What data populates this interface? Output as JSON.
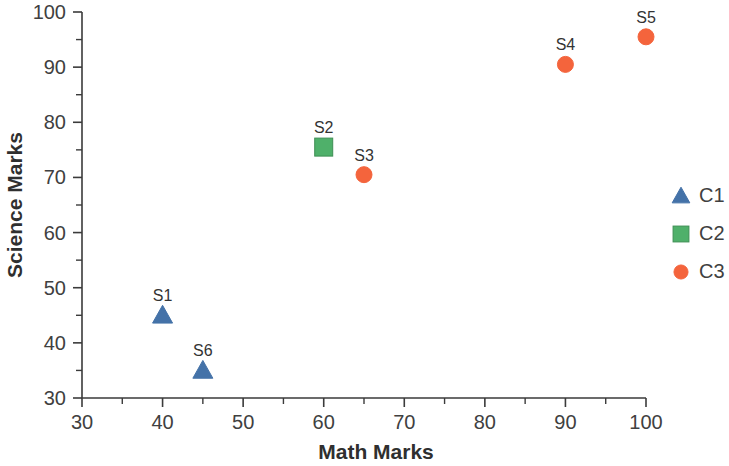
{
  "chart_data": {
    "type": "scatter",
    "title": "",
    "xlabel": "Math Marks",
    "ylabel": "Science Marks",
    "xlim": [
      30,
      100
    ],
    "ylim": [
      30,
      100
    ],
    "x_ticks": [
      30,
      40,
      50,
      60,
      70,
      80,
      90,
      100
    ],
    "y_ticks": [
      30,
      40,
      50,
      60,
      70,
      80,
      90,
      100
    ],
    "x_tick_labels": [
      "30",
      "40",
      "50",
      "60",
      "70",
      "80",
      "90",
      "100"
    ],
    "y_tick_labels": [
      "30",
      "40",
      "50",
      "60",
      "70",
      "80",
      "90",
      "100"
    ],
    "x_minor_step": 5,
    "y_minor_step": 5,
    "grid": false,
    "legend_position": "right",
    "series": [
      {
        "name": "C1",
        "marker": "triangle",
        "color": "#4472A8",
        "points": [
          {
            "label": "S1",
            "x": 40,
            "y": 45
          },
          {
            "label": "S6",
            "x": 45,
            "y": 35
          }
        ]
      },
      {
        "name": "C2",
        "marker": "square",
        "color": "#4FB06A",
        "points": [
          {
            "label": "S2",
            "x": 60,
            "y": 75.5
          }
        ]
      },
      {
        "name": "C3",
        "marker": "circle",
        "color": "#F4643C",
        "points": [
          {
            "label": "S3",
            "x": 65,
            "y": 70.5
          },
          {
            "label": "S4",
            "x": 90,
            "y": 90.5
          },
          {
            "label": "S5",
            "x": 100,
            "y": 95.5
          }
        ]
      }
    ]
  },
  "legend": {
    "entries": [
      {
        "label": "C1",
        "marker": "triangle",
        "color": "#4472A8"
      },
      {
        "label": "C2",
        "marker": "square",
        "color": "#4FB06A"
      },
      {
        "label": "C3",
        "marker": "circle",
        "color": "#F4643C"
      }
    ]
  }
}
